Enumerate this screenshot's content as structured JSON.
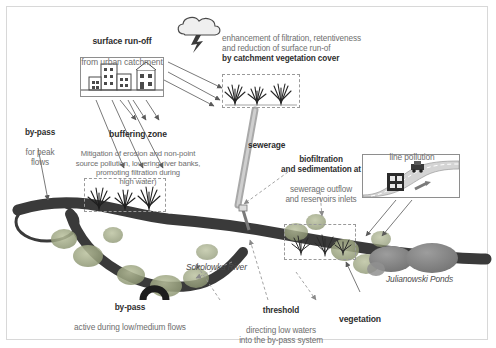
{
  "figure": {
    "title_visible": false,
    "background": "#ffffff",
    "frame_color": "#d8d8d8",
    "river_color": "#3a3a3a",
    "pond_color": "#8c8c8c",
    "vegetation_color": "#9aa37f",
    "heading_color": "#2e2e2e",
    "body_color": "#6e6e6e"
  },
  "labels": {
    "surface_runoff": {
      "heading": "surface run-off",
      "body": "from urban catchment"
    },
    "catchment_cover": {
      "body": "enhancement of filtration, retentiveness\nand reduction of surface run-of",
      "heading": "by catchment vegetation cover"
    },
    "by_pass_peak": {
      "heading": "by-pass",
      "body": "for peak\nflows"
    },
    "buffering_zone": {
      "heading": "buffering zone",
      "body": "Mitigation of erosion and non-point\nsource pollution, lowering river banks,\npromoting filtration during\nhigh water)"
    },
    "sewerage": {
      "heading": "sewerage"
    },
    "biofiltration": {
      "heading": "biofiltration\nand sedimentation at",
      "body": "sewerage outflow\nand reservoirs inlets"
    },
    "line_pollution": {
      "heading": "line pollution"
    },
    "by_pass_low": {
      "heading": "by-pass",
      "body": "active during low/medium flows"
    },
    "threshold": {
      "heading": "threshold",
      "body": "directing low waters\ninto the by-pass system"
    },
    "vegetation": {
      "heading": "vegetation"
    },
    "river_name": "Sokolowka River",
    "ponds_name": "Julianowski Ponds"
  },
  "icons": {
    "cloud": "storm-cloud-with-lightning",
    "buildings": "urban-buildings",
    "grass_top": "grass-tufts-vegetation-strip",
    "grass_buffer": "grass-tufts-river-bank",
    "grass_pond": "grass-tufts-pond-inlet",
    "road": "road-with-vehicles-line-pollution"
  }
}
